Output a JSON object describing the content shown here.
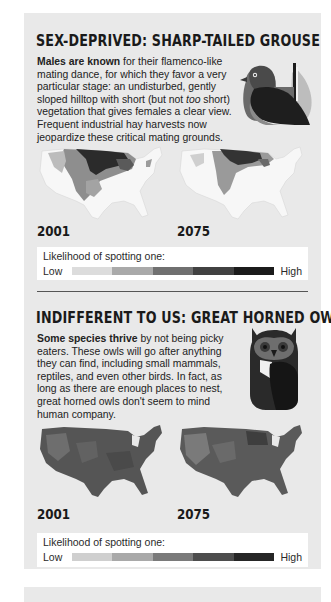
{
  "sections": [
    {
      "id": "grouse",
      "title": "SEX-DEPRIVED: SHARP-TAILED GROUSE",
      "body_bold": "Males are known",
      "body_rest": " for their flamenco-like mating dance, for which they favor a very particular stage: an undisturbed, gently sloped hilltop with short (but not ",
      "body_italic": "too",
      "body_end": " short) vegetation that gives females a clear view. Frequent industrial hay harvests now jeopardize these critical mating grounds.",
      "illustration": "grouse-icon",
      "maps": [
        {
          "year": "2001",
          "pattern": "northern-plains-dense"
        },
        {
          "year": "2075",
          "pattern": "northern-plains-reduced"
        }
      ],
      "legend": {
        "title": "Likelihood of spotting one:",
        "low": "Low",
        "high": "High",
        "colors": [
          "#dcdcdc",
          "#a9a9a9",
          "#707070",
          "#414141",
          "#1b1b1b"
        ]
      }
    },
    {
      "id": "owl",
      "title": "INDIFFERENT TO US: GREAT HORNED OWL",
      "body_bold": "Some species thrive",
      "body_rest": " by not being picky eaters. These owls will go after anything they can find, including small mammals, reptiles, and even other birds. In fact, as long as there are enough places to nest, great horned owls don't seem to mind human company.",
      "illustration": "owl-icon",
      "maps": [
        {
          "year": "2001",
          "pattern": "nationwide-dense"
        },
        {
          "year": "2075",
          "pattern": "nationwide-dense"
        }
      ],
      "legend": {
        "title": "Likelihood of spotting one:",
        "low": "Low",
        "high": "High",
        "colors": [
          "#cfcfcf",
          "#a9a9a9",
          "#7a7a7a",
          "#4d4d4d",
          "#262626"
        ]
      }
    }
  ],
  "colors": {
    "panel_bg": "#e9e9e9",
    "legend_bg": "#ffffff",
    "text": "#1e1e1e"
  }
}
